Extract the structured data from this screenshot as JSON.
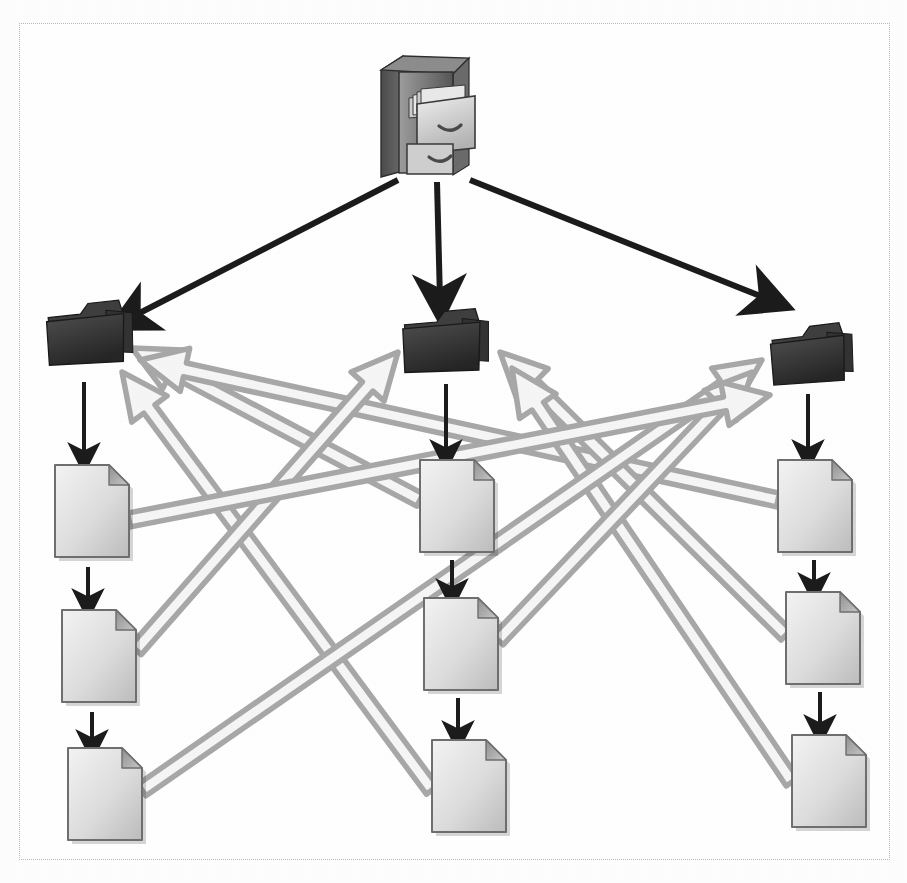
{
  "diagram": {
    "background_color": "#ffffff",
    "frame": {
      "border_style": "dotted",
      "border_color": "#b8b8b8",
      "x": 19,
      "y": 23,
      "width": 871,
      "height": 837
    },
    "colors": {
      "folder_fill": "#3a3a3a",
      "folder_fill_dark": "#2b2b2b",
      "folder_edge": "#1a1a1a",
      "document_fill_light": "#f0f0f0",
      "document_fill_dark": "#c4c4c4",
      "document_edge": "#6f6f6f",
      "document_fold": "#9a9a9a",
      "black_arrow": "#1c1c1c",
      "gray_arrow_stroke": "#a8a8a8",
      "gray_arrow_fill": "#f6f6f6",
      "cabinet_body": "#8a8a8a",
      "cabinet_side": "#5a5a5a",
      "cabinet_top": "#777777",
      "drawer_face": "#d8d8d8"
    },
    "nodes": {
      "cabinet": {
        "label": "file-cabinet",
        "icon": "file-cabinet-icon",
        "x": 377,
        "y": 52,
        "width": 96,
        "height": 125
      },
      "folders": [
        {
          "label": "folder-left",
          "icon": "folder-icon",
          "x": 48,
          "y": 300,
          "width": 86,
          "height": 66,
          "rotate": -6
        },
        {
          "label": "folder-middle",
          "icon": "folder-icon",
          "x": 404,
          "y": 308,
          "width": 86,
          "height": 66,
          "rotate": -5
        },
        {
          "label": "folder-right",
          "icon": "folder-icon",
          "x": 772,
          "y": 323,
          "width": 82,
          "height": 62,
          "rotate": -7
        }
      ],
      "documents": [
        {
          "label": "document-left-1",
          "icon": "document-icon",
          "x": 55,
          "y": 465,
          "width": 74,
          "height": 92
        },
        {
          "label": "document-left-2",
          "icon": "document-icon",
          "x": 62,
          "y": 610,
          "width": 74,
          "height": 92
        },
        {
          "label": "document-left-3",
          "icon": "document-icon",
          "x": 68,
          "y": 748,
          "width": 74,
          "height": 92
        },
        {
          "label": "document-middle-1",
          "icon": "document-icon",
          "x": 420,
          "y": 460,
          "width": 74,
          "height": 92
        },
        {
          "label": "document-middle-2",
          "icon": "document-icon",
          "x": 424,
          "y": 598,
          "width": 74,
          "height": 92
        },
        {
          "label": "document-middle-3",
          "icon": "document-icon",
          "x": 432,
          "y": 740,
          "width": 74,
          "height": 92
        },
        {
          "label": "document-right-1",
          "icon": "document-icon",
          "x": 778,
          "y": 460,
          "width": 74,
          "height": 92
        },
        {
          "label": "document-right-2",
          "icon": "document-icon",
          "x": 786,
          "y": 592,
          "width": 74,
          "height": 92
        },
        {
          "label": "document-right-3",
          "icon": "document-icon",
          "x": 792,
          "y": 735,
          "width": 74,
          "height": 92
        }
      ]
    },
    "edges": {
      "black_distribution": [
        {
          "label": "cabinet-to-folder-left",
          "x1": 398,
          "y1": 180,
          "x2": 130,
          "y2": 318
        },
        {
          "label": "cabinet-to-folder-middle",
          "x1": 437,
          "y1": 182,
          "x2": 440,
          "y2": 300
        },
        {
          "label": "cabinet-to-folder-right",
          "x1": 470,
          "y1": 180,
          "x2": 770,
          "y2": 300
        }
      ],
      "black_chain": [
        {
          "label": "folder-left-to-document-left-1",
          "x1": 84,
          "y1": 382,
          "x2": 84,
          "y2": 458
        },
        {
          "label": "document-left-1-to-document-left-2",
          "x1": 88,
          "y1": 567,
          "x2": 88,
          "y2": 604
        },
        {
          "label": "document-left-2-to-document-left-3",
          "x1": 92,
          "y1": 712,
          "x2": 92,
          "y2": 745
        },
        {
          "label": "folder-middle-to-document-middle-1",
          "x1": 446,
          "y1": 384,
          "x2": 446,
          "y2": 455
        },
        {
          "label": "document-middle-1-to-middle-2",
          "x1": 452,
          "y1": 560,
          "x2": 452,
          "y2": 594
        },
        {
          "label": "document-middle-2-to-middle-3",
          "x1": 458,
          "y1": 698,
          "x2": 458,
          "y2": 736
        },
        {
          "label": "folder-right-to-document-right-1",
          "x1": 808,
          "y1": 394,
          "x2": 808,
          "y2": 455
        },
        {
          "label": "document-right-1-to-right-2",
          "x1": 814,
          "y1": 560,
          "x2": 814,
          "y2": 588
        },
        {
          "label": "document-right-2-to-right-3",
          "x1": 820,
          "y1": 692,
          "x2": 820,
          "y2": 730
        }
      ],
      "gray_cross_references": [
        {
          "label": "document-middle-1-to-folder-left",
          "x1": 420,
          "y1": 500,
          "x2": 132,
          "y2": 348
        },
        {
          "label": "document-right-1-to-folder-left",
          "x1": 778,
          "y1": 500,
          "x2": 140,
          "y2": 360
        },
        {
          "label": "document-middle-3-to-folder-left",
          "x1": 432,
          "y1": 790,
          "x2": 122,
          "y2": 372
        },
        {
          "label": "document-left-2-to-folder-middle",
          "x1": 136,
          "y1": 650,
          "x2": 398,
          "y2": 352
        },
        {
          "label": "document-right-2-to-folder-middle",
          "x1": 786,
          "y1": 635,
          "x2": 500,
          "y2": 352
        },
        {
          "label": "document-right-3-to-folder-middle",
          "x1": 792,
          "y1": 782,
          "x2": 512,
          "y2": 368
        },
        {
          "label": "document-left-3-to-folder-right",
          "x1": 142,
          "y1": 790,
          "x2": 762,
          "y2": 360
        },
        {
          "label": "document-middle-2-to-folder-right",
          "x1": 498,
          "y1": 640,
          "x2": 752,
          "y2": 372
        },
        {
          "label": "document-left-1-to-folder-right",
          "x1": 129,
          "y1": 520,
          "x2": 770,
          "y2": 395
        }
      ]
    }
  }
}
